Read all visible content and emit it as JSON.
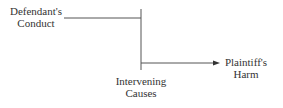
{
  "diagram": {
    "nodes": {
      "defendant": {
        "line1": "Defendant's",
        "line2": "Conduct"
      },
      "intervening": {
        "line1": "Intervening",
        "line2": "Causes"
      },
      "plaintiff": {
        "line1": "Plaintiff's",
        "line2": "Harm"
      }
    },
    "line_color": "#555555"
  }
}
